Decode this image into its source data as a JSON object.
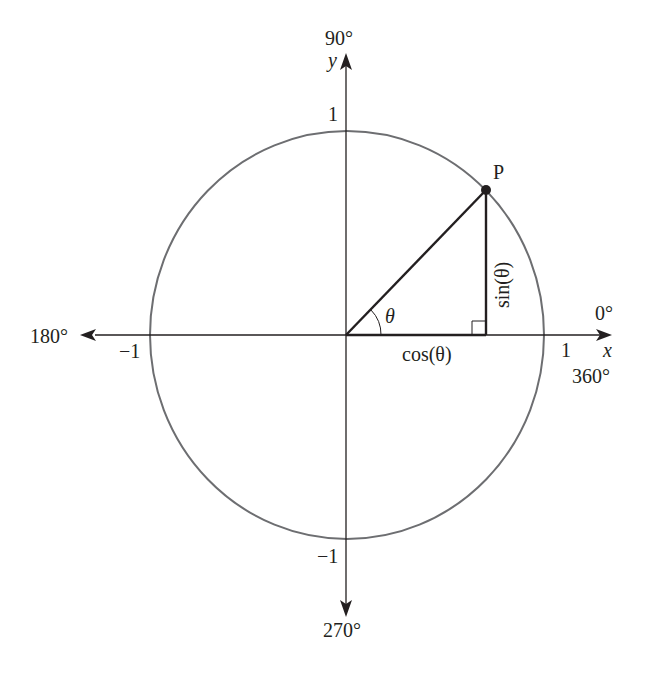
{
  "diagram": {
    "labels": {
      "deg90": "90°",
      "y_axis": "y",
      "x_axis": "x",
      "deg0": "0°",
      "deg360": "360°",
      "deg180": "180°",
      "deg270": "270°",
      "one_top": "1",
      "one_right": "1",
      "neg_one_left": "−1",
      "neg_one_bottom": "−1",
      "point": "P",
      "theta": "θ",
      "sin": "sin(θ)",
      "cos": "cos(θ)"
    },
    "colors": {
      "circle": "#6d6e71",
      "axis": "#231f20",
      "triangle": "#231f20"
    },
    "angle_deg": 45
  }
}
